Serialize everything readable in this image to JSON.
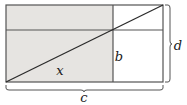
{
  "figure": {
    "type": "geometry-diagram",
    "background_color": "#ffffff",
    "shaded_color": "#e6e4e1",
    "unshaded_color": "#ffffff",
    "stroke_color": "#545454",
    "diagonal_color": "#2b2b2b",
    "brace_color": "#545454",
    "rect": {
      "left": 6,
      "top": 5,
      "right": 163,
      "bottom": 82,
      "width": 157,
      "height": 77
    },
    "divider_horizontal_y": 30,
    "divider_vertical_x": 113,
    "diagonal": {
      "from_x": 6,
      "from_y": 82,
      "to_x": 163,
      "to_y": 5
    },
    "shaded_regions": [
      {
        "name": "top-left-strip",
        "x": 6,
        "y": 5,
        "width": 107,
        "height": 25
      },
      {
        "name": "lower-left-block",
        "x": 6,
        "y": 30,
        "width": 107,
        "height": 52
      }
    ],
    "labels": {
      "x": {
        "text": "x",
        "x": 60,
        "y": 71
      },
      "b": {
        "text": "b",
        "x": 119,
        "y": 57
      },
      "c": {
        "text": "c",
        "x": 84,
        "y": 97
      },
      "d": {
        "text": "d",
        "x": 177,
        "y": 46
      }
    },
    "braces": {
      "bottom": {
        "name": "c-brace",
        "orientation": "horizontal",
        "from_x": 6,
        "to_x": 163,
        "y": 87,
        "label": "c"
      },
      "right": {
        "name": "d-brace",
        "orientation": "vertical",
        "from_y": 5,
        "to_y": 82,
        "x": 168,
        "label": "d"
      }
    }
  }
}
